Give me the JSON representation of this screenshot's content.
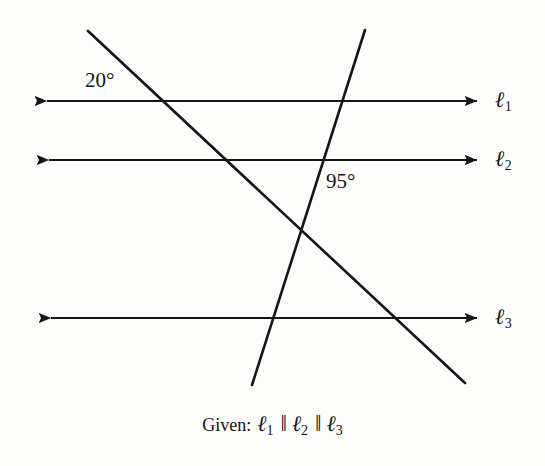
{
  "figure": {
    "background_color": "#fdfdfc",
    "stroke_color": "#151515",
    "parallel_lines": [
      {
        "name": "l1",
        "label": "ℓ",
        "subscript": "1",
        "y": 101,
        "x_start": 34,
        "x_end": 489,
        "label_x": 495,
        "label_y": 89
      },
      {
        "name": "l2",
        "label": "ℓ",
        "subscript": "2",
        "y": 160,
        "x_start": 36,
        "x_end": 489,
        "label_x": 495,
        "label_y": 148
      },
      {
        "name": "l3",
        "label": "ℓ",
        "subscript": "3",
        "y": 318,
        "x_start": 38,
        "x_end": 489,
        "label_x": 495,
        "label_y": 306
      }
    ],
    "transversals": [
      {
        "name": "transversal-down-right",
        "x1": 88,
        "y1": 31,
        "x2": 465,
        "y2": 383
      },
      {
        "name": "transversal-up-right",
        "x1": 252,
        "y1": 385,
        "x2": 365,
        "y2": 30
      }
    ],
    "angle_labels": [
      {
        "name": "angle-20",
        "text": "20°",
        "x": 85,
        "y": 70,
        "value": 20,
        "unit": "degrees"
      },
      {
        "name": "angle-95",
        "text": "95°",
        "x": 326,
        "y": 171,
        "value": 95,
        "unit": "degrees"
      }
    ],
    "given": {
      "word": "Given:",
      "l1": "ℓ",
      "l1_sub": "1",
      "parallel_symbol_1": "‖",
      "l2": "ℓ",
      "l2_sub": "2",
      "parallel_symbol_2": "‖",
      "l3": "ℓ",
      "l3_sub": "3",
      "full_text": "Given: ℓ1 ‖ ℓ2 ‖ ℓ3"
    }
  }
}
